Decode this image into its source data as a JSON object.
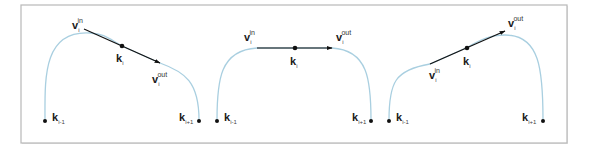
{
  "figure": {
    "colors": {
      "curve": "#a9cfe0",
      "tangent": "#111111",
      "frame": "#b8b8b8",
      "background": "#ffffff"
    },
    "labels": {
      "v": "v",
      "k": "k",
      "in": "in",
      "out": "out",
      "i": "i",
      "i_minus_1": "i-1",
      "i_plus_1": "i+1"
    },
    "panels": [
      {
        "id": "panel-left",
        "tangent_direction": "descending to the right",
        "label_v_in": {
          "main": "v",
          "sub": "i",
          "sup": "in"
        },
        "label_v_out": {
          "main": "v",
          "sub": "i",
          "sup": "out"
        },
        "label_k_i": {
          "main": "k",
          "sub": "i"
        },
        "label_k_prev": {
          "main": "k",
          "sub": "i-1"
        },
        "label_k_next": {
          "main": "k",
          "sub": "i+1"
        }
      },
      {
        "id": "panel-middle",
        "tangent_direction": "horizontal",
        "label_v_in": {
          "main": "v",
          "sub": "i",
          "sup": "in"
        },
        "label_v_out": {
          "main": "v",
          "sub": "i",
          "sup": "out"
        },
        "label_k_i": {
          "main": "k",
          "sub": "i"
        },
        "label_k_prev": {
          "main": "k",
          "sub": "i-1"
        },
        "label_k_next": {
          "main": "k",
          "sub": "i+1"
        }
      },
      {
        "id": "panel-right",
        "tangent_direction": "ascending to the right",
        "label_v_in": {
          "main": "v",
          "sub": "i",
          "sup": "in"
        },
        "label_v_out": {
          "main": "v",
          "sub": "i",
          "sup": "out"
        },
        "label_k_i": {
          "main": "k",
          "sub": "i"
        },
        "label_k_prev": {
          "main": "k",
          "sub": "i-1"
        },
        "label_k_next": {
          "main": "k",
          "sub": "i+1"
        }
      }
    ]
  }
}
